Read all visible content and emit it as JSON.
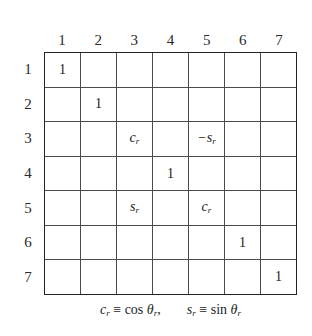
{
  "figure": {
    "kind": "matrix-diagram",
    "size": "7x7",
    "column_headers": [
      "1",
      "2",
      "3",
      "4",
      "5",
      "6",
      "7"
    ],
    "row_headers": [
      "1",
      "2",
      "3",
      "4",
      "5",
      "6",
      "7"
    ],
    "colors": {
      "background": "#ffffff",
      "outer_border": "#242424",
      "grid_line": "#4a4a4a",
      "text": "#1b1b1b"
    },
    "rows": [
      [
        {
          "text": "1",
          "style": "plain"
        },
        {
          "text": "",
          "style": "empty"
        },
        {
          "text": "",
          "style": "empty"
        },
        {
          "text": "",
          "style": "empty"
        },
        {
          "text": "",
          "style": "empty"
        },
        {
          "text": "",
          "style": "empty"
        },
        {
          "text": "",
          "style": "empty"
        }
      ],
      [
        {
          "text": "",
          "style": "empty"
        },
        {
          "text": "1",
          "style": "plain"
        },
        {
          "text": "",
          "style": "empty"
        },
        {
          "text": "",
          "style": "empty"
        },
        {
          "text": "",
          "style": "empty"
        },
        {
          "text": "",
          "style": "empty"
        },
        {
          "text": "",
          "style": "empty"
        }
      ],
      [
        {
          "text": "",
          "style": "empty"
        },
        {
          "text": "",
          "style": "empty"
        },
        {
          "base": "c",
          "sub": "r",
          "style": "symbol"
        },
        {
          "text": "",
          "style": "empty"
        },
        {
          "prefix": "−",
          "base": "s",
          "sub": "r",
          "style": "symbol"
        },
        {
          "text": "",
          "style": "empty"
        },
        {
          "text": "",
          "style": "empty"
        }
      ],
      [
        {
          "text": "",
          "style": "empty"
        },
        {
          "text": "",
          "style": "empty"
        },
        {
          "text": "",
          "style": "empty"
        },
        {
          "text": "1",
          "style": "plain"
        },
        {
          "text": "",
          "style": "empty"
        },
        {
          "text": "",
          "style": "empty"
        },
        {
          "text": "",
          "style": "empty"
        }
      ],
      [
        {
          "text": "",
          "style": "empty"
        },
        {
          "text": "",
          "style": "empty"
        },
        {
          "base": "s",
          "sub": "r",
          "style": "symbol"
        },
        {
          "text": "",
          "style": "empty"
        },
        {
          "base": "c",
          "sub": "r",
          "style": "symbol"
        },
        {
          "text": "",
          "style": "empty"
        },
        {
          "text": "",
          "style": "empty"
        }
      ],
      [
        {
          "text": "",
          "style": "empty"
        },
        {
          "text": "",
          "style": "empty"
        },
        {
          "text": "",
          "style": "empty"
        },
        {
          "text": "",
          "style": "empty"
        },
        {
          "text": "",
          "style": "empty"
        },
        {
          "text": "1",
          "style": "plain"
        },
        {
          "text": "",
          "style": "empty"
        }
      ],
      [
        {
          "text": "",
          "style": "empty"
        },
        {
          "text": "",
          "style": "empty"
        },
        {
          "text": "",
          "style": "empty"
        },
        {
          "text": "",
          "style": "empty"
        },
        {
          "text": "",
          "style": "empty"
        },
        {
          "text": "",
          "style": "empty"
        },
        {
          "text": "1",
          "style": "plain"
        }
      ]
    ],
    "caption": {
      "definitions": [
        {
          "lhs_base": "c",
          "lhs_sub": "r",
          "relation": "≡",
          "rhs_fn": "cos",
          "rhs_base": "θ",
          "rhs_sub": "r",
          "trailing": ","
        },
        {
          "lhs_base": "s",
          "lhs_sub": "r",
          "relation": "≡",
          "rhs_fn": "sin",
          "rhs_base": "θ",
          "rhs_sub": "r",
          "trailing": ""
        }
      ]
    }
  }
}
